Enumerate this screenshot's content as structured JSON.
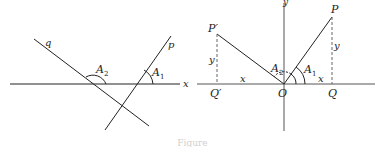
{
  "left_figure": {
    "line_q_label": "q",
    "line_p_label": "p",
    "angle_1_label": "A",
    "angle_1_sub": "1",
    "angle_2_label": "A",
    "angle_2_sub": "2",
    "axis_label": "x"
  },
  "right_figure": {
    "y_axis_label": "y",
    "point_P": "P",
    "point_P_prime": "P′",
    "point_Q": "Q",
    "point_Q_prime": "Q′",
    "origin": "O",
    "angle_1_label": "A",
    "angle_1_sub": "1",
    "angle_2_label": "A",
    "angle_2_sub": "2",
    "x_right": "x",
    "x_left": "x",
    "y_right": "y",
    "y_left": "y"
  },
  "caption": "Figure"
}
